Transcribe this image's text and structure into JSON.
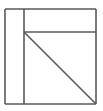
{
  "figure": {
    "kind": "line-drawing",
    "canvas": {
      "width": 103,
      "height": 111,
      "background": "#ffffff"
    },
    "style": {
      "stroke_color": "#5a5a5a",
      "stroke_width": 1.6,
      "fill_color": "#ffffff"
    },
    "bounds": {
      "left": 5,
      "top": 9,
      "right": 96,
      "bottom": 104
    },
    "vertices": {
      "top_left": {
        "x": 5,
        "y": 9
      },
      "top_right": {
        "x": 96,
        "y": 9
      },
      "bottom_right": {
        "x": 96,
        "y": 104
      },
      "bottom_left": {
        "x": 5,
        "y": 104
      },
      "vertical_top": {
        "x": 24,
        "y": 9
      },
      "vertical_bottom": {
        "x": 24,
        "y": 104
      },
      "corner_node": {
        "x": 24,
        "y": 32
      },
      "horizontal_right": {
        "x": 96,
        "y": 32
      }
    },
    "segments": [
      {
        "name": "outer-top-edge",
        "x1": 5,
        "y1": 9,
        "x2": 96,
        "y2": 9
      },
      {
        "name": "outer-right-edge",
        "x1": 96,
        "y1": 9,
        "x2": 96,
        "y2": 104
      },
      {
        "name": "outer-bottom-edge",
        "x1": 96,
        "y1": 104,
        "x2": 5,
        "y2": 104
      },
      {
        "name": "outer-left-edge",
        "x1": 5,
        "y1": 104,
        "x2": 5,
        "y2": 9
      },
      {
        "name": "inner-vertical-divider",
        "x1": 24,
        "y1": 9,
        "x2": 24,
        "y2": 104
      },
      {
        "name": "inner-horizontal-divider",
        "x1": 24,
        "y1": 32,
        "x2": 96,
        "y2": 32
      },
      {
        "name": "diagonal",
        "x1": 24,
        "y1": 32,
        "x2": 96,
        "y2": 104
      }
    ],
    "regions": [
      {
        "name": "left-column",
        "label": ""
      },
      {
        "name": "top-band",
        "label": ""
      },
      {
        "name": "upper-triangle",
        "label": ""
      },
      {
        "name": "lower-triangle",
        "label": ""
      }
    ],
    "labels": []
  }
}
